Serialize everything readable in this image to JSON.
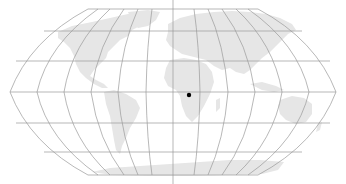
{
  "map": {
    "projection": "Robinson",
    "graticule_color": "#9a9a9a",
    "land_color": "#e6e6e6",
    "background_color": "#ffffff",
    "marker": {
      "label": "",
      "color": "#000000",
      "x": 189,
      "y": 95
    },
    "center_meridian_x": 173,
    "equator_y": 92
  }
}
